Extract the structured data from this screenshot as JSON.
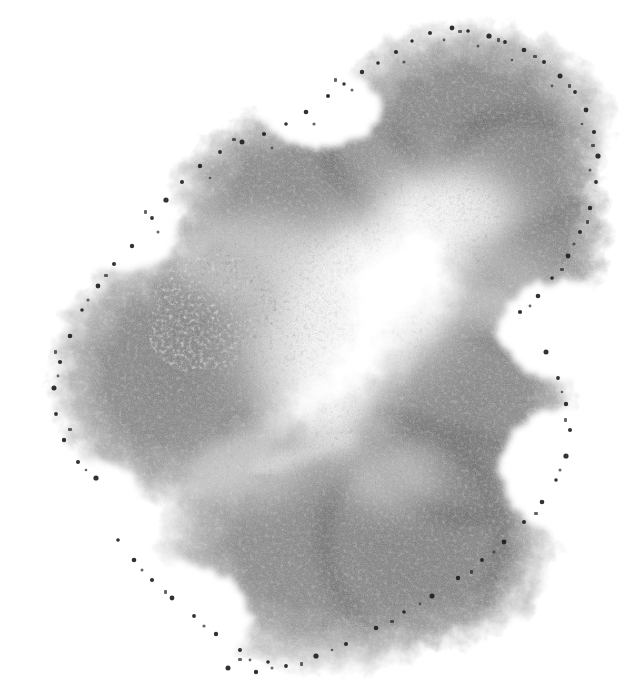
{
  "image": {
    "kind": "natural-image",
    "subject_name": "grayscale-stipple-blob",
    "title": "Grayscale Stipple Blob",
    "description": "Amorphous multi-lobed charcoal or graphite rubbing on white paper, with dark grainy speckled edges, mid-gray mottled interior and a bright white core running diagonally through the centre.",
    "medium": "charcoal / graphite stipple rubbing on white paper",
    "orientation": "portrait",
    "width_px": 626,
    "height_px": 696,
    "has_text": false,
    "has_ui_chrome": false,
    "background_color": "#ffffff"
  },
  "palette": {
    "paper_white": "#ffffff",
    "core_highlight": "#fdfdfd",
    "pale_gray": "#e2e2e2",
    "light_gray": "#c9c9c9",
    "mid_gray": "#a8a8a8",
    "body_gray": "#8f8f8f",
    "deep_gray": "#7a7a7a",
    "edge_gray": "#636363",
    "speckle_dark": "#3a3a3a",
    "speckle_black": "#1c1c1c"
  },
  "composition": {
    "bounding_box": {
      "x": 45,
      "y": 25,
      "width": 555,
      "height": 650
    },
    "extremes": {
      "top_y": 25,
      "top_at_x": 452,
      "bottom_y": 675,
      "bottom_at_x": 240,
      "left_x": 45,
      "left_at_y": 380,
      "right_x": 600,
      "right_at_y": 170
    },
    "overall_tone": "mid-gray",
    "diagonal_axis": "upper-right to lower-left",
    "edge_character": "soft feathered grain with clumped dark speckles along the perimeter"
  },
  "lobes": [
    {
      "name": "upper-right-lobe",
      "cx": 470,
      "cy": 130,
      "rx": 148,
      "ry": 112,
      "tone": "#8d8d8d",
      "note": "largest upper mass, reaches the highest point of the form"
    },
    {
      "name": "upper-left-arm",
      "cx": 300,
      "cy": 195,
      "rx": 132,
      "ry": 90,
      "tone": "#969696",
      "note": "tapering band sweeping down-left from the upper mass"
    },
    {
      "name": "right-shoulder",
      "cx": 520,
      "cy": 230,
      "rx": 92,
      "ry": 118,
      "tone": "#898989",
      "note": "bulge on the far right, widest point of the form"
    },
    {
      "name": "left-lobe",
      "cx": 175,
      "cy": 375,
      "rx": 128,
      "ry": 135,
      "tone": "#8e8e8e",
      "note": "rounded left mass separated by a pale notch"
    },
    {
      "name": "right-lower-lobe",
      "cx": 470,
      "cy": 400,
      "rx": 110,
      "ry": 120,
      "tone": "#8c8c8c",
      "note": "descending right mass below the concave notch"
    },
    {
      "name": "bottom-lobe",
      "cx": 330,
      "cy": 540,
      "rx": 175,
      "ry": 138,
      "tone": "#929292",
      "note": "broad lower mass forming the base of the form"
    },
    {
      "name": "bottom-right-tail",
      "cx": 440,
      "cy": 540,
      "rx": 118,
      "ry": 110,
      "tone": "#8b8b8b",
      "note": "tail merging the bottom and right-lower masses"
    }
  ],
  "highlights": [
    {
      "name": "central-core",
      "cx": 360,
      "cy": 300,
      "rx": 112,
      "ry": 92,
      "tone": "#ffffff",
      "note": "brightest white core, the unmarked paper showing through"
    },
    {
      "name": "upper-core-flare",
      "cx": 450,
      "cy": 215,
      "rx": 90,
      "ry": 52,
      "tone": "#fcfcfc",
      "note": "flare extending up-right from the core"
    },
    {
      "name": "lower-core-finger",
      "cx": 330,
      "cy": 400,
      "rx": 48,
      "ry": 72,
      "tone": "#fafafa",
      "note": "narrow white finger descending from the core"
    },
    {
      "name": "mottled-patch",
      "cx": 215,
      "cy": 305,
      "rx": 62,
      "ry": 52,
      "tone": "#dedede",
      "note": "pale speckled mottled area on the left, a rough rubbing texture"
    },
    {
      "name": "diagonal-streak",
      "x1": 258,
      "y1": 470,
      "x2": 350,
      "y2": 438,
      "tone": "#f2f2f2",
      "note": "thin white scratch-like streak across the lower centre"
    }
  ],
  "notches": [
    {
      "name": "left-upper-notch",
      "cx": 120,
      "cy": 232,
      "rx": 58,
      "ry": 38,
      "note": "white wedge intruding from the left between the arm and the left lobe"
    },
    {
      "name": "left-lower-notch",
      "cx": 95,
      "cy": 508,
      "rx": 52,
      "ry": 48,
      "note": "white bite out of the lower-left perimeter"
    },
    {
      "name": "right-middle-notch",
      "cx": 560,
      "cy": 330,
      "rx": 62,
      "ry": 50,
      "note": "concave indentation between right shoulder and right-lower lobe"
    },
    {
      "name": "top-left-notch",
      "cx": 320,
      "cy": 108,
      "rx": 60,
      "ry": 40,
      "note": "shallow dip along the upper-left contour"
    }
  ],
  "grain": {
    "type": "stipple",
    "fine_density": 0.55,
    "speckle_count": 520,
    "edge_speckle_bias": 0.78,
    "note": "dense fine grain throughout with larger dark clumps concentrated at the perimeter"
  }
}
